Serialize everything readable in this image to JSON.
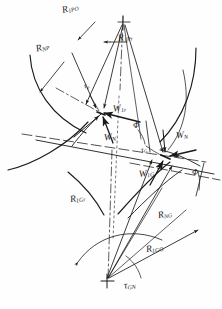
{
  "figure": {
    "background_color": "#fefefe",
    "ink_color": "#1a1a1a",
    "width": 222,
    "height": 309
  },
  "labels": {
    "r1po": {
      "base": "R",
      "sub": "1PO"
    },
    "r1pr": {
      "base": "R",
      "sub": "1Pr"
    },
    "rnp": {
      "base": "R",
      "sub": "NP"
    },
    "w1r": {
      "base": "W",
      "sub": "1r"
    },
    "wn_left": {
      "base": "W",
      "sub": "N"
    },
    "wn_right": {
      "base": "W",
      "sub": "N"
    },
    "w1g": {
      "base": "W",
      "sub": "1G"
    },
    "r1gr": {
      "base": "R",
      "sub": "1Gr"
    },
    "rng": {
      "base": "R",
      "sub": "NG"
    },
    "r1go": {
      "base": "R",
      "sub": "1GO"
    },
    "tau_gn": {
      "base": "τ",
      "sub": "GN"
    },
    "phi_upper": {
      "base": "Φ",
      "sub": ""
    },
    "phi_lower": {
      "base": "Φ",
      "sub": ""
    },
    "tau_p": {
      "base": "τ",
      "sub": "p"
    },
    "tau_g": {
      "base": "τ",
      "sub": "G"
    }
  },
  "geometry": {
    "apex_top": {
      "x": 123,
      "y": 22
    },
    "contact_point_left": {
      "x": 101,
      "y": 113
    },
    "contact_point_right": {
      "x": 166,
      "y": 157
    },
    "pivot_bottom": {
      "x": 107,
      "y": 281
    },
    "angle_phi_upper_deg": 22,
    "angle_phi_lower_deg": 22
  }
}
